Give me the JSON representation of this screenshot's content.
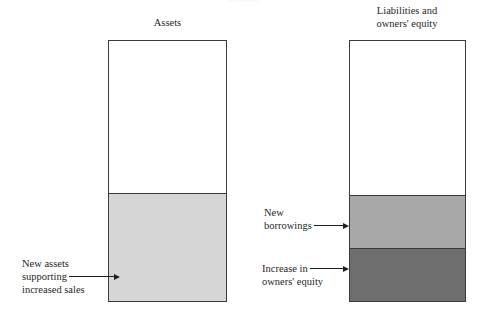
{
  "figure": {
    "clipped_top_title": "Exhibit",
    "background_color": "#ffffff",
    "ink_color": "#1f1f1f"
  },
  "columns": [
    {
      "id": "assets",
      "title": "Assets",
      "segments": [
        {
          "id": "assets-unchanged",
          "label": "",
          "color": "#ffffff",
          "height_px": 153
        },
        {
          "id": "assets-new",
          "label": "New assets supporting increased sales",
          "color": "#d6d6d6",
          "height_px": 109
        }
      ]
    },
    {
      "id": "liabilities",
      "title": "Liabilities and\nowners' equity",
      "segments": [
        {
          "id": "liabilities-unchanged",
          "label": "",
          "color": "#ffffff",
          "height_px": 155
        },
        {
          "id": "new-borrowings",
          "label": "New borrowings",
          "color": "#a8a8a8",
          "height_px": 54
        },
        {
          "id": "increase-owners-equity",
          "label": "Increase in owners' equity",
          "color": "#6e6e6e",
          "height_px": 53
        }
      ]
    }
  ],
  "annotations": {
    "new_assets": {
      "line1": "New assets",
      "line2": "supporting",
      "line3": "increased sales",
      "points_to": "assets-new"
    },
    "new_borrowings": {
      "line1": "New",
      "line2": "borrowings",
      "points_to": "new-borrowings"
    },
    "increase_owners_equity": {
      "line1": "Increase in",
      "line2": "owners' equity",
      "points_to": "increase-owners-equity"
    }
  }
}
